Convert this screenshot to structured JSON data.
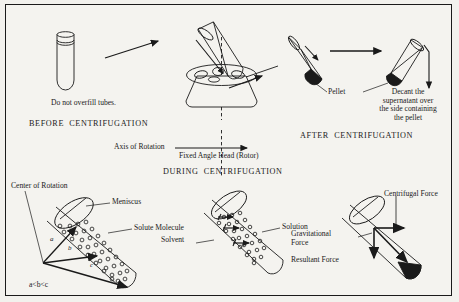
{
  "figure": {
    "border_color": "#1a1a1a",
    "background_color": "#f4f3ef",
    "ink_color": "#1a1a1a"
  },
  "stages": {
    "before": {
      "caption": "BEFORE  CENTRIFUGATION",
      "note": "Do not overfill tubes."
    },
    "during": {
      "caption": "DURING  CENTRIFUGATION"
    },
    "after": {
      "caption": "AFTER  CENTRIFUGATION"
    }
  },
  "rotor": {
    "label": "Fixed Angle Head (Rotor)",
    "axis_label": "Axis of Rotation"
  },
  "after_labels": {
    "pellet": "Pellet",
    "decant": "Decant the\nsupernatant over\nthe side containing\nthe pellet"
  },
  "during_left_tube": {
    "center_of_rotation": "Center of Rotation",
    "meniscus": "Meniscus",
    "solute_molecule": "Solute Molecule",
    "vector_a": "a",
    "vector_b": "b",
    "vector_c": "c",
    "inequality": "a<b<c"
  },
  "during_middle_tube": {
    "solution": "Solution",
    "solvent": "Solvent"
  },
  "during_right_tube": {
    "centrifugal_force": "Centrifugal Force",
    "gravitational_force": "Gravitational\nForce",
    "resultant_force": "Resultant Force"
  }
}
